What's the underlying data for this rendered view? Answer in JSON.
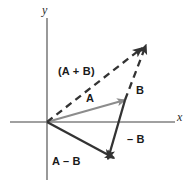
{
  "figure": {
    "width": 193,
    "height": 193,
    "background": "#ffffff"
  },
  "axes": {
    "x_label": "x",
    "y_label": "y",
    "color": "#808080",
    "origin": {
      "x": 47,
      "y": 122
    },
    "x_axis": {
      "x1": 10,
      "y1": 122,
      "x2": 175,
      "y2": 122
    },
    "y_axis": {
      "x1": 47,
      "y1": 18,
      "x2": 47,
      "y2": 180
    }
  },
  "labels": {
    "sum": "(A + B)",
    "a": "A",
    "b": "B",
    "neg_b": "– B",
    "a_minus_b": "A – B"
  },
  "colors": {
    "vector_a": "#8c8c8c",
    "vector_dark": "#333333",
    "axis": "#8a8a8a",
    "text": "#1a1a1a"
  },
  "chart_data": {
    "type": "scatter",
    "xlabel": "x",
    "ylabel": "y",
    "grid": false,
    "legend": "none",
    "vectors": [
      {
        "name": "A",
        "label": "A",
        "style": "solid",
        "color": "#8c8c8c",
        "start": {
          "x": 47,
          "y": 122
        },
        "end": {
          "x": 125,
          "y": 100
        },
        "label_pos": {
          "x": 86,
          "y": 93
        }
      },
      {
        "name": "B",
        "label": "B",
        "style": "dashed",
        "color": "#333333",
        "start": {
          "x": 125,
          "y": 100
        },
        "end": {
          "x": 146,
          "y": 45
        },
        "label_pos": {
          "x": 136,
          "y": 85
        }
      },
      {
        "name": "A_plus_B",
        "label": "(A + B)",
        "style": "dashed",
        "color": "#333333",
        "start": {
          "x": 47,
          "y": 122
        },
        "end": {
          "x": 142,
          "y": 48
        },
        "label_pos": {
          "x": 58,
          "y": 66
        }
      },
      {
        "name": "neg_B",
        "label": "– B",
        "style": "solid",
        "color": "#333333",
        "start": {
          "x": 125,
          "y": 100
        },
        "end": {
          "x": 108,
          "y": 159
        },
        "label_pos": {
          "x": 127,
          "y": 134
        }
      },
      {
        "name": "A_minus_B",
        "label": "A – B",
        "style": "solid",
        "color": "#333333",
        "start": {
          "x": 47,
          "y": 122
        },
        "end": {
          "x": 114,
          "y": 158
        },
        "label_pos": {
          "x": 52,
          "y": 156
        }
      }
    ]
  }
}
